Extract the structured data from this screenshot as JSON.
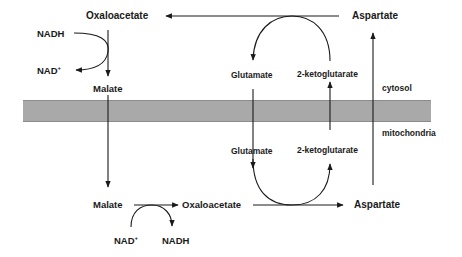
{
  "diagram": {
    "compartments": {
      "top": "cytosol",
      "bottom": "mitochondria"
    },
    "membrane_color": "#a9a9a9",
    "line_color": "#1a1a1a",
    "cytosol": {
      "oxaloacetate": "Oxaloacetate",
      "aspartate": "Aspartate",
      "nadh": "NADH",
      "nad_plus": "NAD",
      "nad_plus_sup": "+",
      "malate": "Malate",
      "glutamate": "Glutamate",
      "ketoglutarate": "2-ketoglutarate"
    },
    "mitochondria": {
      "malate": "Malate",
      "oxaloacetate": "Oxaloacetate",
      "aspartate": "Aspartate",
      "nad_plus": "NAD",
      "nad_plus_sup": "+",
      "nadh": "NADH",
      "glutamate": "Glutamate",
      "ketoglutarate": "2-ketoglutarate"
    },
    "nodes": [
      {
        "id": "cyt-oxaloacetate",
        "label": "Oxaloacetate",
        "compartment": "cytosol"
      },
      {
        "id": "cyt-aspartate",
        "label": "Aspartate",
        "compartment": "cytosol"
      },
      {
        "id": "cyt-malate",
        "label": "Malate",
        "compartment": "cytosol"
      },
      {
        "id": "cyt-glutamate",
        "label": "Glutamate",
        "compartment": "cytosol"
      },
      {
        "id": "cyt-2-ketoglutarate",
        "label": "2-ketoglutarate",
        "compartment": "cytosol"
      },
      {
        "id": "cyt-nadh",
        "label": "NADH",
        "compartment": "cytosol"
      },
      {
        "id": "cyt-nad",
        "label": "NAD+",
        "compartment": "cytosol"
      },
      {
        "id": "mit-malate",
        "label": "Malate",
        "compartment": "mitochondria"
      },
      {
        "id": "mit-oxaloacetate",
        "label": "Oxaloacetate",
        "compartment": "mitochondria"
      },
      {
        "id": "mit-aspartate",
        "label": "Aspartate",
        "compartment": "mitochondria"
      },
      {
        "id": "mit-glutamate",
        "label": "Glutamate",
        "compartment": "mitochondria"
      },
      {
        "id": "mit-2-ketoglutarate",
        "label": "2-ketoglutarate",
        "compartment": "mitochondria"
      },
      {
        "id": "mit-nad",
        "label": "NAD+",
        "compartment": "mitochondria"
      },
      {
        "id": "mit-nadh",
        "label": "NADH",
        "compartment": "mitochondria"
      }
    ],
    "edges": [
      {
        "from": "cyt-aspartate",
        "to": "cyt-oxaloacetate",
        "coupled": "cyt-2-ketoglutarate -> cyt-glutamate"
      },
      {
        "from": "cyt-oxaloacetate",
        "to": "cyt-malate",
        "coupled": "cyt-nadh -> cyt-nad"
      },
      {
        "from": "cyt-malate",
        "to": "mit-malate",
        "crosses_membrane": true
      },
      {
        "from": "mit-malate",
        "to": "mit-oxaloacetate",
        "coupled": "mit-nad -> mit-nadh"
      },
      {
        "from": "mit-oxaloacetate",
        "to": "mit-aspartate",
        "coupled": "mit-glutamate -> mit-2-ketoglutarate"
      },
      {
        "from": "mit-aspartate",
        "to": "cyt-aspartate",
        "crosses_membrane": true
      },
      {
        "from": "cyt-glutamate",
        "to": "mit-glutamate",
        "crosses_membrane": true
      },
      {
        "from": "mit-2-ketoglutarate",
        "to": "cyt-2-ketoglutarate",
        "crosses_membrane": true
      }
    ]
  }
}
